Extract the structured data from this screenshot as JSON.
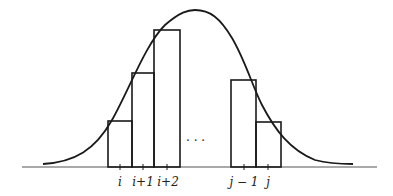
{
  "diagram": {
    "colors": {
      "stroke": "#1a1a1a",
      "axis": "#555555",
      "background": "#ffffff"
    },
    "baseline": {
      "x1": 22,
      "x2": 377,
      "y": 167
    },
    "curve": {
      "start": [
        43,
        164
      ],
      "peak": [
        190,
        10
      ],
      "end": [
        353,
        164
      ]
    },
    "bars": [
      {
        "id": "i",
        "x": 108,
        "width": 24,
        "top": 121
      },
      {
        "id": "i+1",
        "x": 132,
        "width": 22,
        "top": 73
      },
      {
        "id": "i+2",
        "x": 154,
        "width": 26,
        "top": 30
      },
      {
        "id": "j-1",
        "x": 231,
        "width": 25,
        "top": 80
      },
      {
        "id": "j",
        "x": 256,
        "width": 25,
        "top": 122
      }
    ],
    "ellipsis": "· · ·",
    "ticks": [
      {
        "x": 120,
        "label": "i"
      },
      {
        "x": 143,
        "label": "i+1"
      },
      {
        "x": 167,
        "label": "i+2"
      },
      {
        "x": 244,
        "label": "j − 1"
      },
      {
        "x": 268,
        "label": "j"
      }
    ]
  }
}
